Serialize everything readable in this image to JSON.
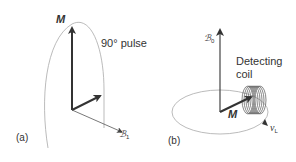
{
  "panel_a": {
    "label": "(a)",
    "magnetization_label": "M",
    "pulse_label": "90° pulse",
    "field_label": "ℬ",
    "field_subscript": "1"
  },
  "panel_b": {
    "label": "(b)",
    "field_label": "ℬ",
    "field_subscript": "0",
    "coil_label_line1": "Detecting",
    "coil_label_line2": "coil",
    "magnetization_label": "M",
    "frequency_label": "ν",
    "frequency_subscript": "L"
  },
  "colors": {
    "arrow": "#333333",
    "thin_line": "#555555",
    "arc": "#aaaaaa",
    "text": "#333333"
  }
}
